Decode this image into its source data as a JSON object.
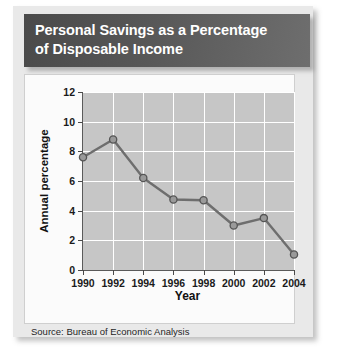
{
  "title": {
    "line1": "Personal Savings as a Percentage",
    "line2": "of Disposable Income"
  },
  "source": "Source: Bureau of Economic Analysis",
  "colors": {
    "title_bar": "#4a4a4a",
    "panel": "#e9e9e9",
    "plot_background": "#c6c6c6",
    "gridline": "#ffffff",
    "line": "#6e6e6e",
    "marker_fill": "#9a9a9a",
    "marker_edge": "#555555",
    "axis": "#5a5a5a"
  },
  "chart_data": {
    "type": "line",
    "title": "Personal Savings as a Percentage of Disposable Income",
    "xlabel": "Year",
    "ylabel": "Annual percentage",
    "x": [
      1990,
      1992,
      1994,
      1996,
      1998,
      2000,
      2002,
      2004
    ],
    "values": [
      7.6,
      8.8,
      6.2,
      4.75,
      4.7,
      3.0,
      3.5,
      1.05
    ],
    "xticklabels": [
      "1990",
      "1992",
      "1994",
      "1996",
      "1998",
      "2000",
      "2002",
      "2004"
    ],
    "yticks": [
      0,
      2,
      4,
      6,
      8,
      10,
      12
    ],
    "yticklabels": [
      "0",
      "2",
      "4",
      "6",
      "8",
      "10",
      "12"
    ],
    "xlim": [
      1990,
      2004
    ],
    "ylim": [
      0,
      12
    ],
    "grid": true,
    "legend": false,
    "marker": "circle"
  }
}
